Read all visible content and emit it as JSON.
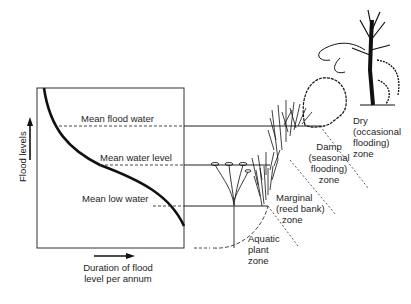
{
  "graph": {
    "y_axis_label": "Flood levels",
    "x_axis_label_line1": "Duration of flood",
    "x_axis_label_line2": "level per annum",
    "levels": {
      "flood": "Mean flood water",
      "mean": "Mean water level",
      "low": "Mean low water"
    }
  },
  "zones": {
    "dry": [
      "Dry",
      "(occasional",
      "flooding)",
      "zone"
    ],
    "damp": [
      "Damp",
      "(seasonal",
      "flooding)",
      "zone"
    ],
    "marginal": [
      "Marginal",
      "(reed bank)",
      "zone"
    ],
    "aquatic": [
      "Aquatic",
      "plant",
      "zone"
    ]
  },
  "colors": {
    "ink": "#1a1a1a",
    "background": "#ffffff"
  }
}
